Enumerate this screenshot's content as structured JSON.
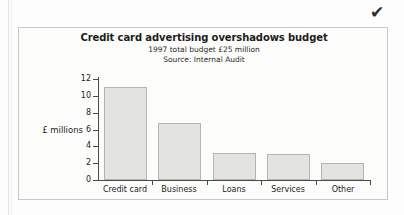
{
  "page": {
    "checkmark_icon": "✔"
  },
  "chart_data": {
    "type": "bar",
    "title": "Credit card advertising overshadows budget",
    "subtitle": "1997 total budget £25 million",
    "source": "Source: Internal Audit",
    "xlabel": "",
    "ylabel": "£ millions",
    "categories": [
      "Credit card",
      "Business",
      "Loans",
      "Services",
      "Other"
    ],
    "values": [
      11.1,
      6.8,
      3.2,
      3.1,
      2.0
    ],
    "ylim": [
      0,
      12
    ],
    "yticks": [
      0,
      2,
      4,
      6,
      8,
      10,
      12
    ],
    "ytick_labels": [
      "0",
      "2",
      "4",
      "6",
      "8",
      "10",
      "12"
    ],
    "grid": false,
    "legend": false,
    "bar_fill_color": "#e3e3e0",
    "bar_border_color": "#b4b4b0",
    "axis_color": "#4a4a4a"
  }
}
